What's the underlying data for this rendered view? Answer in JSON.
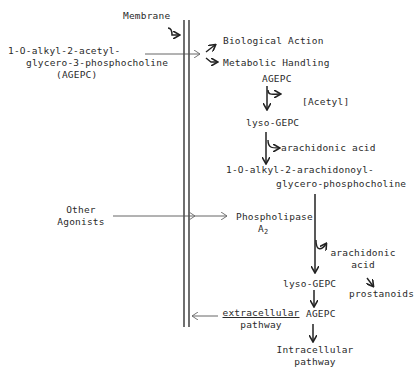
{
  "diagram": {
    "membrane_label": "Membrane",
    "agepc_full": {
      "line1": "1-O-alkyl-2-acetyl-",
      "line2": "glycero-3-phosphocholine",
      "line3": "(AGEPC)"
    },
    "outcomes": {
      "biological_action": "Biological Action",
      "metabolic_handling": "Metabolic Handling"
    },
    "metabolism": {
      "agepc": "AGEPC",
      "acetyl": "[Acetyl]",
      "lyso_gepc": "lyso-GEPC",
      "arachidonic_acid": "arachidonic acid",
      "product_line1": "1-O-alkyl-2-arachidonoyl-",
      "product_line2": "glycero-phosphocholine"
    },
    "other_agonists": {
      "line1": "Other",
      "line2": "Agonists"
    },
    "phospholipase": {
      "name": "Phospholipase",
      "sub_prefix": "A",
      "sub": "2"
    },
    "release": {
      "arachidonic_line1": "arachidonic",
      "arachidonic_line2": "acid",
      "prostanoids": "prostanoids"
    },
    "resynthesis": {
      "lyso_gepc": "lyso-GEPC",
      "agepc": "AGEPC",
      "extracellular_line1": "extracellular",
      "extracellular_line2": "pathway",
      "intracellular_line1": "Intracellular",
      "intracellular_line2": "pathway"
    }
  }
}
